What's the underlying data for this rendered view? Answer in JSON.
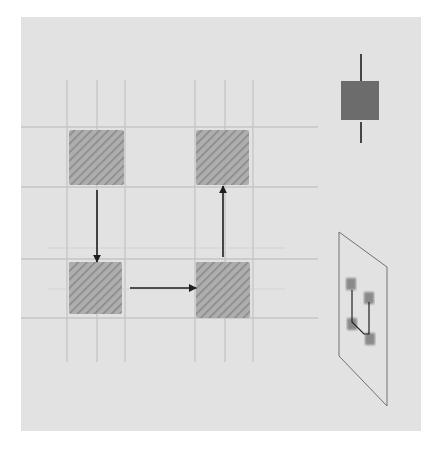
{
  "diagram": {
    "title": "",
    "background_color": "#e2e2e2",
    "grid": {
      "line_color": "#c4c4c4",
      "vertical_x": [
        67,
        97,
        125,
        195,
        225,
        253
      ],
      "horizontal_y": [
        127,
        187,
        259,
        318
      ],
      "faint_horizontal_y": [
        248,
        289
      ]
    },
    "cells": [
      {
        "id": "top-left",
        "x": 69,
        "y": 130,
        "w": 55,
        "h": 55
      },
      {
        "id": "top-right",
        "x": 196,
        "y": 130,
        "w": 53,
        "h": 55
      },
      {
        "id": "bottom-left",
        "x": 69,
        "y": 262,
        "w": 53,
        "h": 52
      },
      {
        "id": "bottom-right",
        "x": 196,
        "y": 262,
        "w": 54,
        "h": 56
      }
    ],
    "cell_color": "#9a9a9a",
    "arrows": [
      {
        "id": "down",
        "from": "top-left",
        "to": "bottom-left",
        "x1": 97,
        "y1": 190,
        "x2": 97,
        "y2": 262
      },
      {
        "id": "right",
        "from": "bottom-left",
        "to": "bottom-right",
        "x1": 130,
        "y1": 288,
        "x2": 196,
        "y2": 288
      },
      {
        "id": "up",
        "from": "bottom-right",
        "to": "top-right",
        "x1": 223,
        "y1": 257,
        "x2": 223,
        "y2": 186
      }
    ],
    "arrow_color": "#1e1e1e",
    "legend_icon": {
      "square": {
        "x": 341,
        "y": 81,
        "w": 38,
        "h": 39,
        "color": "#6c6c6c"
      },
      "line_in": {
        "x": 361,
        "y1": 54,
        "y2": 88
      },
      "line_out": {
        "x": 361,
        "y1": 122,
        "y2": 143
      }
    },
    "inset_plane": {
      "points": [
        [
          339,
          232
        ],
        [
          387,
          267
        ],
        [
          387,
          406
        ],
        [
          339,
          356
        ]
      ],
      "stroke": "#707070"
    }
  }
}
